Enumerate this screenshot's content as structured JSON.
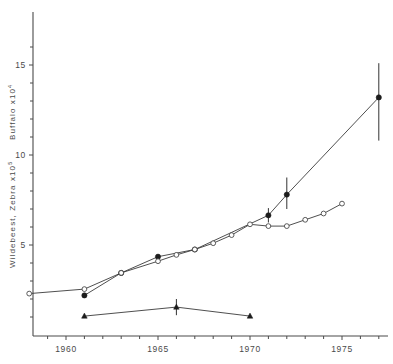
{
  "chart_data": {
    "type": "line",
    "title": "",
    "subtitle": "",
    "xlabel": "",
    "ylabel_primary": "Wildebeest, Zebra  x10",
    "ylabel_primary_exponent": "5",
    "ylabel_secondary": "Buffalo  x10",
    "ylabel_secondary_exponent": "4",
    "xlim": [
      1957.4,
      1978.2
    ],
    "ylim": [
      0,
      17.1
    ],
    "grid": false,
    "legend": "none",
    "x_ticks_major": [
      1960,
      1965,
      1970,
      1975
    ],
    "x_tick_labels": [
      "1960",
      "1965",
      "1970",
      "1975"
    ],
    "x_ticks_minor": [
      1958,
      1959,
      1961,
      1962,
      1963,
      1964,
      1966,
      1967,
      1968,
      1969,
      1971,
      1972,
      1973,
      1974,
      1976,
      1977,
      1978
    ],
    "y_ticks_major": [
      5,
      10,
      15
    ],
    "y_tick_labels": [
      "5",
      "10",
      "15"
    ],
    "y_ticks_minor": [
      1,
      2,
      3,
      4,
      6,
      7,
      8,
      9,
      11,
      12,
      13,
      14,
      16
    ],
    "series": [
      {
        "name": "Wildebeest",
        "marker": "filled-circle",
        "x": [
          1961,
          1963,
          1965,
          1967,
          1971,
          1972,
          1977
        ],
        "values": [
          2.2,
          3.45,
          4.35,
          4.75,
          6.65,
          7.8,
          13.2
        ],
        "errors": [
          {
            "x": 1971,
            "low": 6.25,
            "high": 7.05
          },
          {
            "x": 1972,
            "low": 7.0,
            "high": 8.75
          },
          {
            "x": 1977,
            "low": 10.8,
            "high": 15.1
          }
        ]
      },
      {
        "name": "Zebra",
        "marker": "open-circle",
        "x": [
          1958,
          1961,
          1963,
          1965,
          1966,
          1967,
          1968,
          1969,
          1970,
          1971,
          1972,
          1973,
          1974,
          1975
        ],
        "values": [
          2.3,
          2.55,
          3.45,
          4.1,
          4.45,
          4.75,
          5.1,
          5.55,
          6.15,
          6.05,
          6.05,
          6.4,
          6.75,
          7.3
        ],
        "errors": []
      },
      {
        "name": "Buffalo",
        "marker": "filled-triangle",
        "x": [
          1961,
          1966,
          1970
        ],
        "values": [
          1.05,
          1.55,
          1.05
        ],
        "errors": [
          {
            "x": 1966,
            "low": 1.1,
            "high": 2.0
          }
        ]
      }
    ]
  },
  "colors": {
    "axis": "#4a4a4a",
    "line": "#3b3b3b",
    "marker_fill": "#1c1c1c",
    "marker_open_fill": "#ffffff",
    "background": "#ffffff"
  }
}
